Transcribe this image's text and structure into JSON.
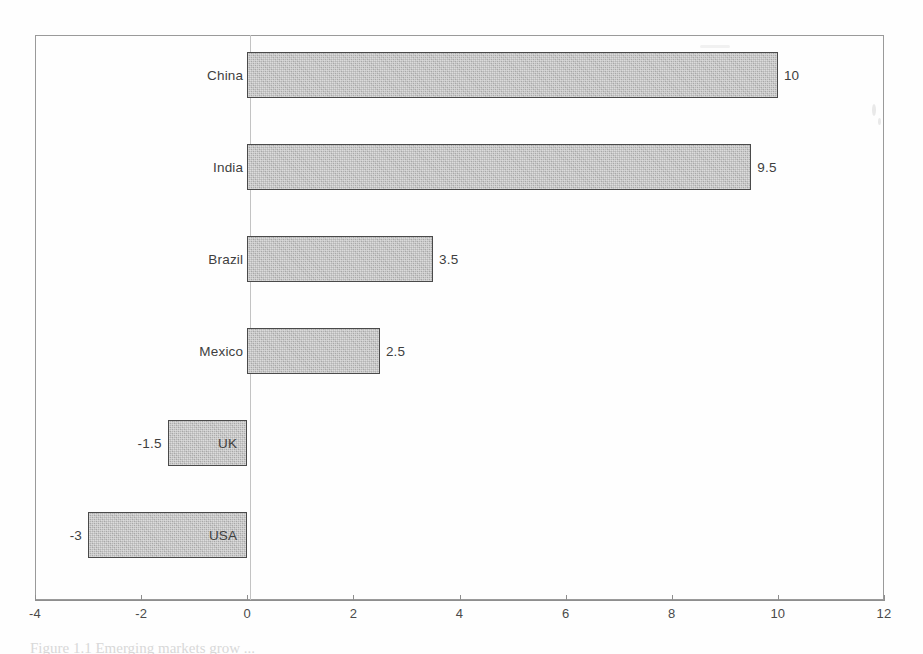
{
  "chart_data": {
    "type": "bar",
    "orientation": "horizontal",
    "title": "",
    "subtitle": "",
    "xlabel": "",
    "ylabel": "",
    "categories": [
      "China",
      "India",
      "Brazil",
      "Mexico",
      "UK",
      "USA"
    ],
    "values": [
      10,
      9.5,
      3.5,
      2.5,
      -1.5,
      -3
    ],
    "value_labels": [
      "10",
      "9.5",
      "3.5",
      "2.5",
      "-1.5",
      "-3"
    ],
    "series": [
      {
        "name": "",
        "values": [
          10,
          9.5,
          3.5,
          2.5,
          -1.5,
          -3
        ]
      }
    ],
    "xlim": [
      -4,
      12
    ],
    "xticks": [
      -4,
      -2,
      0,
      2,
      4,
      6,
      8,
      10,
      12
    ],
    "xtick_labels": [
      "-4",
      "-2",
      "0",
      "2",
      "4",
      "6",
      "8",
      "10",
      "12"
    ],
    "grid": false,
    "legend": false,
    "legend_position": "none",
    "bar_fill_color": "#b4b4b4",
    "bar_border_color": "#4a4a4a",
    "axis_color": "#8e8e8e",
    "zero_line_color": "#c3c3c3",
    "annotations": []
  },
  "figure": {
    "caption_fragment": "Figure 1.1  Emerging markets grow ..."
  }
}
